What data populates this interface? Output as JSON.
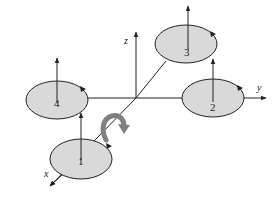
{
  "diagram": {
    "type": "quadcopter-rotor-layout",
    "axes": [
      {
        "name": "x",
        "label": "x"
      },
      {
        "name": "y",
        "label": "y"
      },
      {
        "name": "z",
        "label": "z"
      }
    ],
    "rotors": [
      {
        "id": "1",
        "label": "1"
      },
      {
        "id": "2",
        "label": "2"
      },
      {
        "id": "3",
        "label": "3"
      },
      {
        "id": "4",
        "label": "4"
      }
    ],
    "colors": {
      "disc_fill": "#d9d9d9",
      "stroke": "#222222",
      "rotation_arrow": "#808080"
    }
  }
}
